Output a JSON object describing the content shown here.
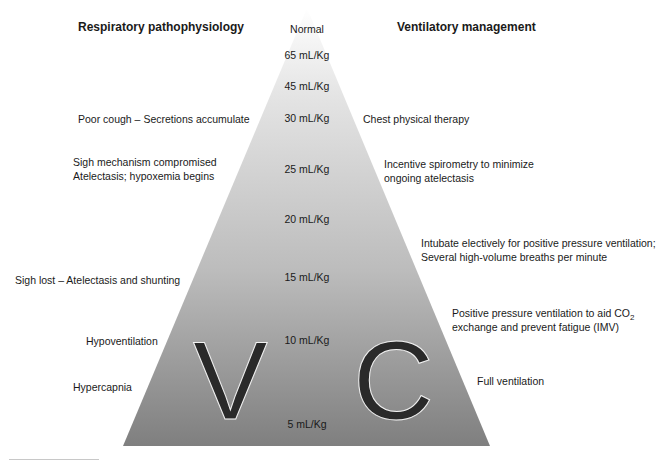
{
  "headers": {
    "left": "Respiratory pathophysiology",
    "right": "Ventilatory management"
  },
  "volumes": [
    "Normal",
    "65 mL/Kg",
    "45 mL/Kg",
    "30 mL/Kg",
    "25 mL/Kg",
    "20 mL/Kg",
    "15 mL/Kg",
    "10 mL/Kg",
    "5 mL/Kg"
  ],
  "pathophysiology": [
    "Poor cough – Secretions accumulate",
    "Sigh mechanism compromised",
    "Atelectasis; hypoxemia begins",
    "Sigh lost – Atelectasis and shunting",
    "Hypoventilation",
    "Hypercapnia"
  ],
  "management": [
    "Chest physical therapy",
    "Incentive spirometry to minimize",
    "ongoing atelectasis",
    "Intubate electively for positive pressure ventilation;",
    "Several high-volume breaths per minute",
    "Positive pressure ventilation to aid CO",
    "2",
    "exchange and prevent fatigue (IMV)",
    "Full ventilation"
  ],
  "letters": {
    "left": "V",
    "right": "C"
  },
  "colors": {
    "pyramid_top": "#ffffff",
    "pyramid_bottom": "#7f7f7f",
    "letter": "#2a2a2a"
  }
}
